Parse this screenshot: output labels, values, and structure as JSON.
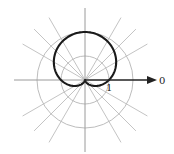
{
  "chart_data": {
    "type": "line",
    "subtype": "polar",
    "title": "",
    "equation": "r = 1 + sin(theta)",
    "curve_name": "cardioid",
    "series": [
      {
        "name": "r = 1 + sin θ",
        "theta_deg": [
          0,
          30,
          60,
          90,
          120,
          150,
          180,
          210,
          240,
          270,
          300,
          330,
          360
        ],
        "r": [
          1,
          1.5,
          1.866,
          2,
          1.866,
          1.5,
          1,
          0.5,
          0.134,
          0,
          0.134,
          0.5,
          1
        ]
      }
    ],
    "grid": {
      "circles_r": [
        1,
        2
      ],
      "radial_lines_deg": [
        0,
        30,
        45,
        60,
        90,
        120,
        135,
        150,
        180,
        210,
        225,
        240,
        270,
        300,
        315,
        330
      ]
    },
    "labels": {
      "polar_axis": "0",
      "unit_tick": "1"
    },
    "rlim": [
      0,
      2
    ]
  },
  "colors": {
    "curve": "#1a1a1a",
    "grid": "#bdbdbd",
    "axis": "#222222"
  }
}
